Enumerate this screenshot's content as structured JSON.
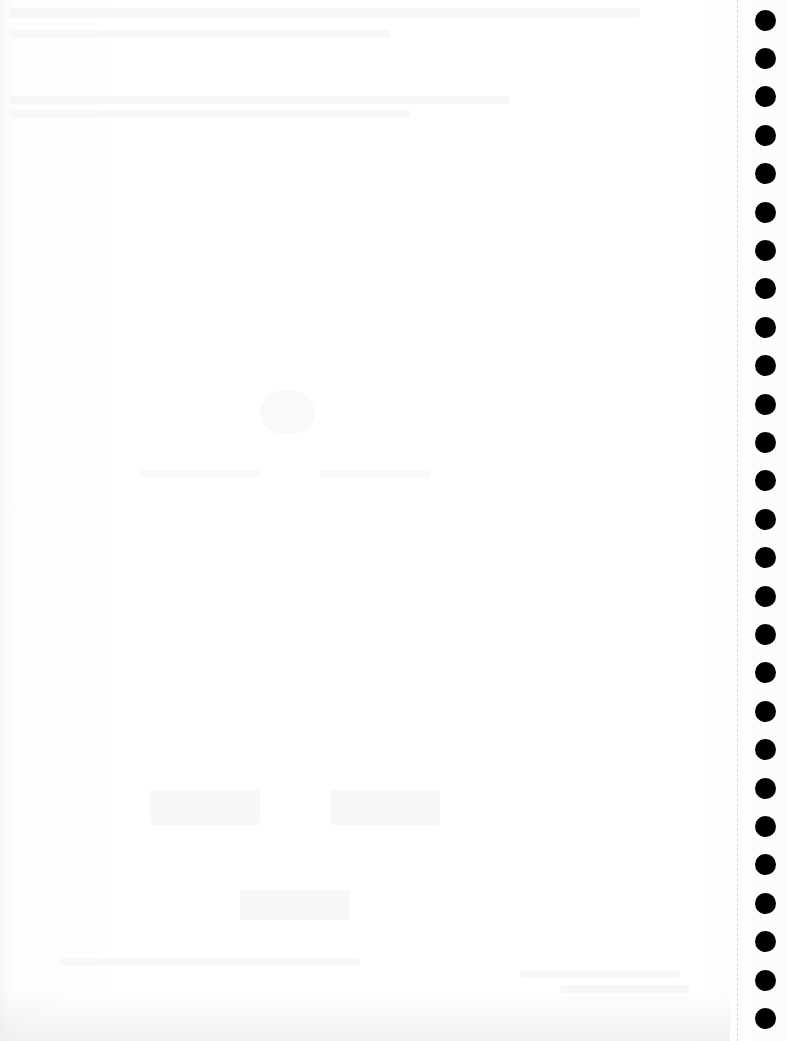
{
  "page": {
    "type": "hole-punched paper sheet",
    "content_legible": false,
    "background_color": "#fdfdfd"
  },
  "binding": {
    "hole_count": 27,
    "hole_color": "#000000",
    "hole_diameter_px": 21,
    "first_hole_center_y": 20,
    "hole_spacing_px": 38.4,
    "perforation_color": "#d8d8d8"
  }
}
